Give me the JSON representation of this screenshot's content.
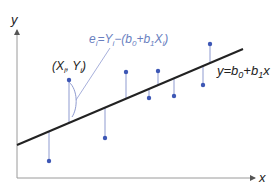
{
  "diagram": {
    "axes": {
      "x_label": "x",
      "y_label": "y",
      "color": "#9a9a9a"
    },
    "regression_line": {
      "label": "y=b₀+b₁x",
      "label_parts": {
        "lhs": "y=b",
        "sub0": "0",
        "mid": "+b",
        "sub1": "1",
        "rhs": "x"
      },
      "x1": 17,
      "y1": 145,
      "x2": 243,
      "y2": 49,
      "color": "#222222"
    },
    "residual_formula": {
      "text": "eᵢ=Yᵢ−(b₀+b₁Xᵢ)",
      "parts": {
        "e": "e",
        "i1": "i",
        "eq": "=Y",
        "i2": "i",
        "minus": "−(b",
        "sub0": "0",
        "plus": "+b",
        "sub1": "1",
        "X": "X",
        "i3": "i",
        "close": ")"
      },
      "color": "#6a7fbf"
    },
    "point_label": {
      "text": "(Xᵢ, Yᵢ)",
      "parts": {
        "open": "(X",
        "i1": "i",
        "comma": ", Y",
        "i2": "i",
        "close": ")"
      }
    },
    "point_color": "#3d57b5",
    "residual_color": "#8f9bd0",
    "points": [
      {
        "x": 49,
        "y": 161
      },
      {
        "x": 69,
        "y": 80
      },
      {
        "x": 105,
        "y": 138
      },
      {
        "x": 126,
        "y": 72
      },
      {
        "x": 149,
        "y": 98
      },
      {
        "x": 158,
        "y": 71
      },
      {
        "x": 174,
        "y": 96
      },
      {
        "x": 203,
        "y": 85
      },
      {
        "x": 210,
        "y": 44
      }
    ]
  }
}
